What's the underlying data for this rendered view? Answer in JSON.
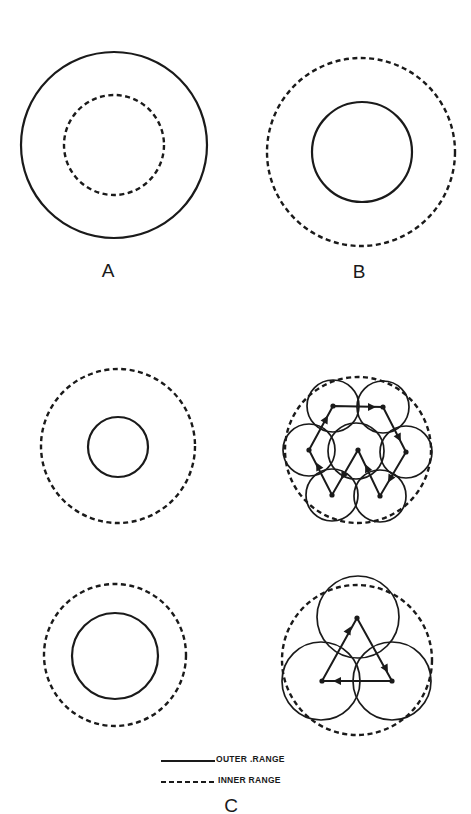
{
  "figure": {
    "panels": [
      {
        "id": "A",
        "label": "A",
        "description": "Outer range (solid) larger than inner range (dashed)",
        "outer_range": {
          "style": "solid",
          "cx": 114,
          "cy": 145,
          "r": 93
        },
        "inner_range": {
          "style": "dashed",
          "cx": 114,
          "cy": 145,
          "r": 50
        }
      },
      {
        "id": "B",
        "label": "B",
        "description": "Inner range (dashed) larger than outer range (solid)",
        "inner_range": {
          "style": "dashed",
          "cx": 361,
          "cy": 152,
          "r": 94
        },
        "outer_range": {
          "style": "solid",
          "cx": 362,
          "cy": 152,
          "r": 50
        }
      },
      {
        "id": "C",
        "label": "C",
        "subpanels": [
          {
            "id": "C-top-left",
            "inner_range": {
              "style": "dashed",
              "cx": 118,
              "cy": 446,
              "r": 77
            },
            "outer_range": {
              "style": "solid",
              "cx": 118,
              "cy": 447,
              "r": 30
            }
          },
          {
            "id": "C-top-right",
            "inner_range": {
              "style": "dashed",
              "cx": 358,
              "cy": 450,
              "r": 73
            },
            "node_circle_radius": 26,
            "nodes": [
              {
                "name": "top-left",
                "x": 333,
                "y": 406
              },
              {
                "name": "top-right",
                "x": 383,
                "y": 407
              },
              {
                "name": "right",
                "x": 406,
                "y": 452
              },
              {
                "name": "bottom-right",
                "x": 380,
                "y": 496
              },
              {
                "name": "center",
                "x": 358,
                "y": 450
              },
              {
                "name": "bottom-left",
                "x": 332,
                "y": 495
              },
              {
                "name": "left",
                "x": 309,
                "y": 450
              }
            ],
            "path_order": [
              "top-left",
              "top-right",
              "right",
              "bottom-right",
              "center",
              "bottom-left",
              "left",
              "top-left"
            ]
          },
          {
            "id": "C-bottom-left",
            "inner_range": {
              "style": "dashed",
              "cx": 115,
              "cy": 655,
              "r": 71
            },
            "outer_range": {
              "style": "solid",
              "cx": 115,
              "cy": 656,
              "r": 43
            }
          },
          {
            "id": "C-bottom-right",
            "inner_range": {
              "style": "dashed",
              "cx": 357,
              "cy": 660,
              "r": 75
            },
            "node_circle_radius": 40,
            "nodes": [
              {
                "name": "top",
                "x": 357,
                "y": 618
              },
              {
                "name": "bottom-right",
                "x": 392,
                "y": 681
              },
              {
                "name": "bottom-left",
                "x": 322,
                "y": 681
              }
            ],
            "path_order": [
              "top",
              "bottom-right",
              "bottom-left",
              "top"
            ]
          }
        ]
      }
    ],
    "legend": {
      "items": [
        {
          "line_style": "solid",
          "label": "OUTER .RANGE"
        },
        {
          "line_style": "dashed",
          "label": "INNER RANGE"
        }
      ]
    },
    "stroke_color": "#1a1a1a",
    "background_color": "#ffffff"
  }
}
